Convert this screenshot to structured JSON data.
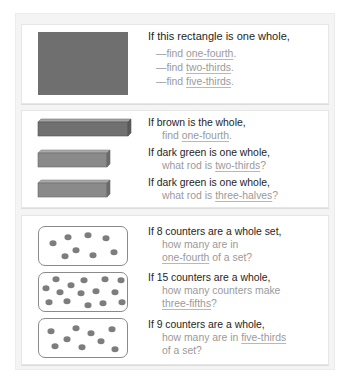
{
  "panel1": {
    "shape": "gray-rectangle",
    "prompt": "If this rectangle is one whole,",
    "items": [
      {
        "prefix": "—find ",
        "term": "one-fourth",
        "suffix": "."
      },
      {
        "prefix": "—find ",
        "term": "two-thirds",
        "suffix": "."
      },
      {
        "prefix": "—find ",
        "term": "five-thirds",
        "suffix": "."
      }
    ]
  },
  "panel2": {
    "rows": [
      {
        "rod": "brown",
        "prompt": "If brown is the whole,",
        "pre": "find ",
        "term": "one-fourth",
        "post": "."
      },
      {
        "rod": "dark-green",
        "prompt": "If dark green is one whole,",
        "pre": "what rod is ",
        "term": "two-thirds",
        "post": "?"
      },
      {
        "rod": "dark-green",
        "prompt": "If dark green is one whole,",
        "pre": "what rod is ",
        "term": "three-halves",
        "post": "?"
      }
    ]
  },
  "panel3": {
    "rows": [
      {
        "count": 8,
        "prompt": "If 8 counters are a whole set,",
        "line1": "how many are in",
        "term": "one-fourth",
        "post": " of a set?"
      },
      {
        "count": 15,
        "prompt": "If 15 counters are a whole,",
        "line1": "how many counters make",
        "term": "three-fifths",
        "post": "?"
      },
      {
        "count": 9,
        "prompt": "If 9 counters are a whole,",
        "line1_pre": "how many are in ",
        "term": "five-thirds",
        "line2": "of a set?"
      }
    ]
  },
  "colors": {
    "shape_gray": "#6f6f6f",
    "prompt_text": "#1e1e1e",
    "sub_text": "#9a9a9a",
    "panel_bg": "#f4f4f4"
  }
}
